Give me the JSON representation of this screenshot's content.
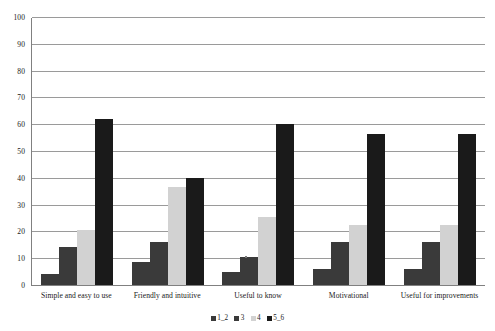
{
  "chart_data": {
    "type": "bar",
    "title": "",
    "subtitle": "",
    "xlabel": "",
    "ylabel": "",
    "ylim": [
      0,
      100
    ],
    "y_ticks": [
      0,
      10,
      20,
      30,
      40,
      50,
      60,
      70,
      80,
      90,
      100
    ],
    "grid": true,
    "legend_position": "bottom",
    "orientation": "vertical",
    "categories": [
      "Simple and easy to use",
      "Friendly and intuitive",
      "Useful to know",
      "Motivational",
      "Useful for improvements"
    ],
    "series": [
      {
        "name": "1_2",
        "color": "#3a3a3a",
        "values": [
          4,
          8.5,
          4.8,
          6,
          6
        ]
      },
      {
        "name": "3",
        "color": "#3a3a3a",
        "values": [
          14,
          16,
          10.5,
          16,
          16
        ]
      },
      {
        "name": "4",
        "color": "#d2d2d2",
        "values": [
          20.5,
          36.5,
          25.3,
          22.5,
          22.5
        ]
      },
      {
        "name": "5_6",
        "color": "#1a1a1a",
        "values": [
          62,
          40,
          60,
          56.5,
          56.5
        ]
      }
    ]
  },
  "axis": {
    "y_tick_labels": [
      "0",
      "10",
      "20",
      "30",
      "40",
      "50",
      "60",
      "70",
      "80",
      "90",
      "100"
    ]
  },
  "colors": {
    "series_1_2": "#3a3a3a",
    "series_3": "#3a3a3a",
    "series_4": "#d2d2d2",
    "series_5_6": "#1a1a1a",
    "gridline": "#9a9a9a",
    "axis_line": "#808080",
    "background": "#ffffff",
    "text": "#1a1a1a"
  }
}
